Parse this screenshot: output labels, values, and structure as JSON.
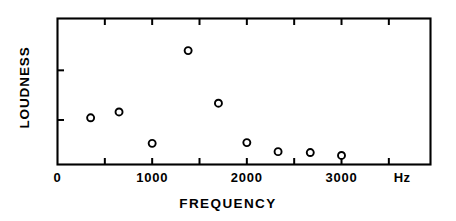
{
  "chart_data": {
    "type": "scatter",
    "title": "",
    "xlabel": "FREQUENCY",
    "ylabel": "LOUDNESS",
    "unit_label": "Hz",
    "xlim": [
      0,
      3940
    ],
    "ylim": [
      0,
      1
    ],
    "grid": false,
    "legend": null,
    "x_tick_labels": [
      "0",
      "1000",
      "2000",
      "3000"
    ],
    "x_tick_label_values": [
      0,
      1000,
      2000,
      3000
    ],
    "x_minor_tick_values": [
      500,
      1000,
      1500,
      2000,
      2500,
      3000,
      3500
    ],
    "y_tick_values": [
      0.305,
      0.645
    ],
    "y_tick_labels": [
      "",
      ""
    ],
    "marker": "open-circle",
    "x": [
      350,
      650,
      1000,
      1380,
      1700,
      2000,
      2330,
      2670,
      3000
    ],
    "y": [
      0.32,
      0.36,
      0.145,
      0.78,
      0.42,
      0.15,
      0.088,
      0.082,
      0.062
    ],
    "points": [
      {
        "x": 350,
        "y": 0.32
      },
      {
        "x": 650,
        "y": 0.36
      },
      {
        "x": 1000,
        "y": 0.145
      },
      {
        "x": 1380,
        "y": 0.78
      },
      {
        "x": 1700,
        "y": 0.42
      },
      {
        "x": 2000,
        "y": 0.15
      },
      {
        "x": 2330,
        "y": 0.088
      },
      {
        "x": 2670,
        "y": 0.082
      },
      {
        "x": 3000,
        "y": 0.062
      }
    ],
    "colors": {
      "axis": "#000000",
      "marker": "#000000",
      "background": "#ffffff"
    }
  }
}
